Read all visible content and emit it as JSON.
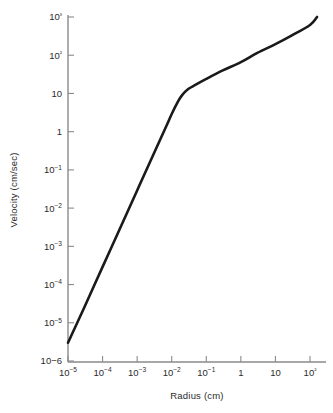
{
  "chart_data": {
    "type": "line",
    "title": "",
    "xlabel": "Radius (cm)",
    "ylabel": "Velocity (cm/sec)",
    "xscale": "log",
    "yscale": "log",
    "xlim": [
      1e-05,
      100.0
    ],
    "ylim": [
      1e-06,
      1000.0
    ],
    "grid": false,
    "legend": false,
    "x_tick_labels": [
      "10−5",
      "10−4",
      "10−3",
      "10−2",
      "10−1",
      "1",
      "10",
      "10²"
    ],
    "x_tick_values": [
      1e-05,
      0.0001,
      0.001,
      0.01,
      0.1,
      1,
      10,
      100
    ],
    "y_tick_labels": [
      "10³",
      "10²",
      "10",
      "1",
      "10−1",
      "10−2",
      "10−3",
      "10−4",
      "10−5",
      "10−6"
    ],
    "y_tick_values": [
      1000,
      100,
      10,
      1,
      0.1,
      0.01,
      0.001,
      0.0001,
      1e-05,
      1e-06
    ],
    "series": [
      {
        "name": "Terminal velocity",
        "color": "#1a1a1a",
        "x": [
          1e-05,
          3e-05,
          0.0001,
          0.0003,
          0.001,
          0.003,
          0.007,
          0.01,
          0.015,
          0.02,
          0.03,
          0.05,
          0.1,
          0.3,
          1,
          3,
          10,
          30,
          100,
          160
        ],
        "y": [
          3e-06,
          2.6e-05,
          0.00029,
          0.0026,
          0.029,
          0.26,
          1.4,
          2.9,
          6.0,
          9.0,
          13.0,
          17.0,
          24.0,
          40.0,
          66.0,
          115.0,
          195.0,
          330.0,
          620.0,
          1000.0
        ]
      }
    ]
  },
  "axis_labels": {
    "x_title": "Radius (cm)",
    "y_title": "Velocity (cm/sec)"
  }
}
